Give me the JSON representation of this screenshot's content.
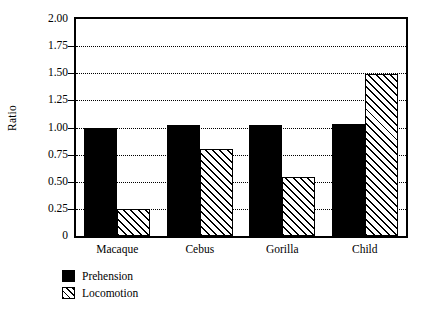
{
  "chart_data": {
    "type": "bar",
    "title": "",
    "xlabel": "",
    "ylabel": "Ratio",
    "ylim": [
      0,
      2.0
    ],
    "grid": true,
    "legend_position": "below-left",
    "categories": [
      "Macaque",
      "Cebus",
      "Gorilla",
      "Child"
    ],
    "ytick_labels": [
      "2.00",
      "1.75",
      "1.50",
      "1.25",
      "1.00",
      "0.75",
      "0.50",
      "0.25",
      "0"
    ],
    "ytick_values": [
      2.0,
      1.75,
      1.5,
      1.25,
      1.0,
      0.75,
      0.5,
      0.25,
      0
    ],
    "gridline_values": [
      1.75,
      1.5,
      1.25,
      1.0,
      0.75,
      0.5,
      0.25
    ],
    "series": [
      {
        "name": "Prehension",
        "fill": "solid-black",
        "color": "#000000",
        "values": [
          1.0,
          1.02,
          1.02,
          1.03
        ]
      },
      {
        "name": "Locomotion",
        "fill": "diagonal-hatch",
        "color": "#000000",
        "values": [
          0.25,
          0.8,
          0.54,
          1.49
        ]
      }
    ]
  },
  "legend": {
    "items": [
      {
        "label": "Prehension",
        "swatch": "solid-black-square"
      },
      {
        "label": "Locomotion",
        "swatch": "hatched-square"
      }
    ]
  }
}
